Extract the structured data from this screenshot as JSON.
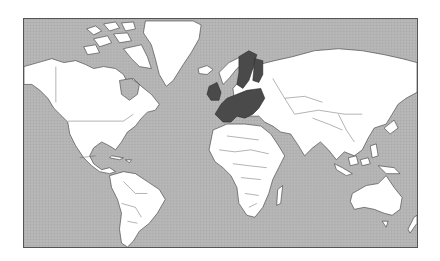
{
  "map": {
    "title": "World map with European Union member states highlighted",
    "projection": "Mercator",
    "colors": {
      "ocean": "#b4b4b4",
      "land": "#ffffff",
      "highlight": "#4a4a4a",
      "border": "#3a3a3a",
      "frame": "#555555"
    },
    "highlighted_region": "European Union",
    "regions": [
      "North America",
      "Greenland",
      "South America",
      "Europe",
      "Africa",
      "Asia",
      "Australia",
      "New Zealand"
    ]
  }
}
